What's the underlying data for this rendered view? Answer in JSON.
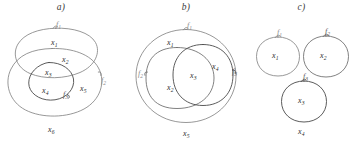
{
  "figure": {
    "caption_style": "three set-theoretic region diagrams",
    "panels": [
      {
        "id": "a",
        "title": "a)",
        "boundary_labels": [
          {
            "name": "f1",
            "text": "f",
            "sub": "1"
          },
          {
            "name": "f2",
            "text": "f",
            "sub": "2"
          },
          {
            "name": "f3",
            "text": "f",
            "sub": "3"
          }
        ],
        "region_labels": [
          {
            "name": "x1",
            "text": "x",
            "sub": "1"
          },
          {
            "name": "x2",
            "text": "x",
            "sub": "2"
          },
          {
            "name": "x3",
            "text": "x",
            "sub": "3"
          },
          {
            "name": "x4",
            "text": "x",
            "sub": "4"
          },
          {
            "name": "x5",
            "text": "x",
            "sub": "5"
          },
          {
            "name": "x6",
            "text": "x",
            "sub": "6"
          }
        ]
      },
      {
        "id": "b",
        "title": "b)",
        "boundary_labels": [
          {
            "name": "f1",
            "text": "f",
            "sub": "1"
          },
          {
            "name": "f2",
            "text": "f",
            "sub": "2"
          },
          {
            "name": "f3",
            "text": "f",
            "sub": "3"
          }
        ],
        "region_labels": [
          {
            "name": "x1",
            "text": "x",
            "sub": "1"
          },
          {
            "name": "x2",
            "text": "x",
            "sub": "2"
          },
          {
            "name": "x3",
            "text": "x",
            "sub": "3"
          },
          {
            "name": "x4",
            "text": "x",
            "sub": "4"
          },
          {
            "name": "x5",
            "text": "x",
            "sub": "5"
          }
        ]
      },
      {
        "id": "c",
        "title": "c)",
        "boundary_labels": [
          {
            "name": "f1",
            "text": "f",
            "sub": "1"
          },
          {
            "name": "f2",
            "text": "f",
            "sub": "2"
          },
          {
            "name": "f3",
            "text": "f",
            "sub": "3"
          }
        ],
        "region_labels": [
          {
            "name": "x1",
            "text": "x",
            "sub": "1"
          },
          {
            "name": "x2",
            "text": "x",
            "sub": "2"
          },
          {
            "name": "x3",
            "text": "x",
            "sub": "3"
          },
          {
            "name": "x4",
            "text": "x",
            "sub": "4"
          }
        ]
      }
    ]
  },
  "colors": {
    "background": "#ffffff",
    "stroke_light": "#7d7d7d",
    "stroke_mid": "#6a6a6a",
    "stroke_dark": "#4a4a4a",
    "text": "#2e2e2e"
  }
}
